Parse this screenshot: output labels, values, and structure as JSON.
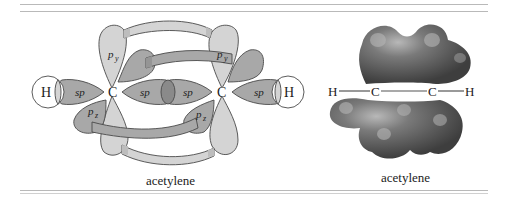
{
  "figure": {
    "left_panel": {
      "caption": "acetylene",
      "atoms": {
        "h_left": "H",
        "c_left": "C",
        "c_right": "C",
        "h_right": "H"
      },
      "orbital_labels": {
        "sp_h_left": "sp",
        "sp_c_left": "sp",
        "sp_c_right": "sp",
        "sp_h_right": "sp",
        "py_left": "p",
        "py_left_sub": "y",
        "py_right": "p",
        "py_right_sub": "y",
        "pz_left": "p",
        "pz_left_sub": "z",
        "pz_right": "p",
        "pz_right_sub": "z"
      }
    },
    "right_panel": {
      "caption": "acetylene",
      "atoms": {
        "h_left": "H",
        "c_left": "C",
        "c_right": "C",
        "h_right": "H"
      }
    },
    "colors": {
      "light_lobe": "#d4d4d4",
      "mid_lobe": "#a8a8a8",
      "overlap": "#8a8a8a",
      "outline": "#4a4a4a",
      "surface_dark": "#5e5e5e",
      "surface_mid": "#7a7a7a",
      "rule": "#b9b9b9"
    }
  }
}
